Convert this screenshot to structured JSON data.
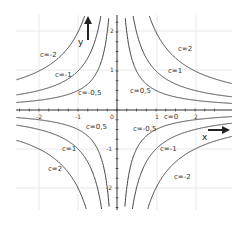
{
  "chart_data": {
    "type": "line",
    "title": "",
    "function": "y = c / x",
    "xlabel": "x",
    "ylabel": "y",
    "xlim": [
      -2.5,
      2.5
    ],
    "ylim": [
      -2.5,
      2.5
    ],
    "grid": true,
    "x_ticks": [
      -2,
      -1,
      0,
      1,
      2
    ],
    "y_ticks": [
      -2,
      -1,
      0,
      1,
      2
    ],
    "x_tick_labels": [
      "-2",
      "-1",
      "0",
      "1",
      "2"
    ],
    "y_tick_labels": [
      "-2",
      "-1",
      "",
      "1",
      "2"
    ],
    "series": [
      {
        "name": "c=2",
        "c": 2,
        "branches": "quadrants I and III"
      },
      {
        "name": "c=1",
        "c": 1,
        "branches": "quadrants I and III"
      },
      {
        "name": "c=0,5",
        "c": 0.5,
        "branches": "quadrants I and III"
      },
      {
        "name": "c=0",
        "c": 0,
        "branches": "x-axis"
      },
      {
        "name": "c=-0,5",
        "c": -0.5,
        "branches": "quadrants II and IV"
      },
      {
        "name": "c=-1",
        "c": -1,
        "branches": "quadrants II and IV"
      },
      {
        "name": "c=-2",
        "c": -2,
        "branches": "quadrants II and IV"
      }
    ],
    "annotations": [
      {
        "text": "c=2",
        "quadrant": "I"
      },
      {
        "text": "c=1",
        "quadrant": "I"
      },
      {
        "text": "c=0,5",
        "quadrant": "I"
      },
      {
        "text": "c=-2",
        "quadrant": "II"
      },
      {
        "text": "c=-1",
        "quadrant": "II"
      },
      {
        "text": "c=-0,5",
        "quadrant": "II"
      },
      {
        "text": "c=0,5",
        "quadrant": "III"
      },
      {
        "text": "c=1",
        "quadrant": "III"
      },
      {
        "text": "c=2",
        "quadrant": "III"
      },
      {
        "text": "c=-0,5",
        "quadrant": "IV"
      },
      {
        "text": "c=-1",
        "quadrant": "IV"
      },
      {
        "text": "c=-2",
        "quadrant": "IV"
      },
      {
        "text": "c=0",
        "position": "on x-axis near x=1.5"
      }
    ]
  },
  "labels": {
    "x_axis": "x",
    "y_axis": "y",
    "q1": [
      "c=2",
      "c=1",
      "c=0,5"
    ],
    "q2": [
      "c=-2",
      "c=-1",
      "c=-0,5"
    ],
    "q3": [
      "c=0,5",
      "c=1",
      "c=2"
    ],
    "q4": [
      "c=-0,5",
      "c=-1",
      "c=-2"
    ],
    "c0": "c=0",
    "xt": [
      "-2",
      "-1",
      "0",
      "1",
      "2"
    ],
    "yt": [
      "2",
      "1",
      "-1",
      "-2"
    ]
  },
  "colors": {
    "curve": "#444444",
    "axis": "#333333",
    "grid": "#e2e2e2",
    "arrow": "#222222"
  }
}
